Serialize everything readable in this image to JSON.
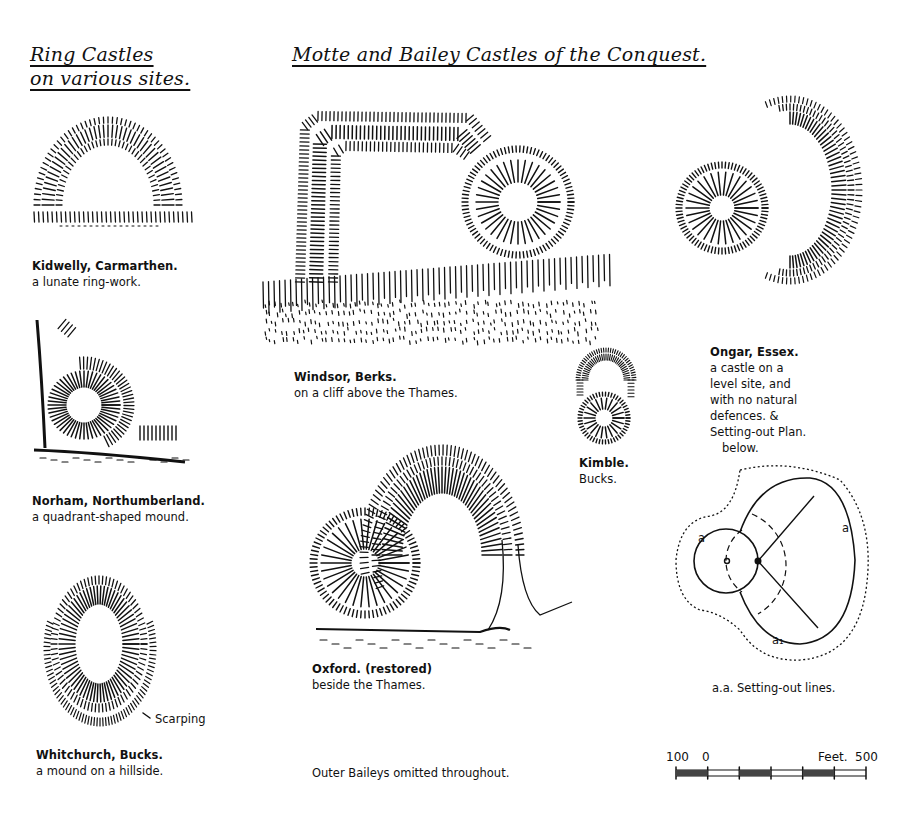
{
  "headings": {
    "ring_castles": [
      "Ring Castles",
      "on various sites."
    ],
    "motte_bailey": "Motte and Bailey Castles of the Conquest."
  },
  "plans": [
    {
      "id": "kidwelly",
      "title": "Kidwelly, Carmarthen.",
      "subtitle": "a lunate ring-work.",
      "category": "Ring Castle"
    },
    {
      "id": "norham",
      "title": "Norham, Northumberland.",
      "subtitle": "a quadrant-shaped mound.",
      "category": "Ring Castle"
    },
    {
      "id": "whitchurch",
      "title": "Whitchurch, Bucks.",
      "subtitle": "a mound on a hillside.",
      "category": "Ring Castle",
      "annotation": "Scarping"
    },
    {
      "id": "windsor",
      "title": "Windsor, Berks.",
      "subtitle": "on a cliff above the Thames.",
      "category": "Motte and Bailey"
    },
    {
      "id": "oxford",
      "title": "Oxford. (restored)",
      "subtitle": "beside the Thames.",
      "category": "Motte and Bailey"
    },
    {
      "id": "kimble",
      "title": "Kimble.",
      "subtitle": "Bucks.",
      "category": "Motte and Bailey"
    },
    {
      "id": "ongar",
      "title": "Ongar, Essex.",
      "subtitle_lines": [
        "a castle on a",
        "level site, and",
        "with no natural",
        "defences. &",
        "Setting-out Plan.",
        "below."
      ],
      "category": "Motte and Bailey"
    }
  ],
  "setting_out_plan": {
    "caption": "a.a. Setting-out lines.",
    "labels": [
      "a",
      "a",
      "a₁"
    ]
  },
  "footer_note": "Outer Baileys omitted throughout.",
  "scale_bar": {
    "unit_label": "Feet.",
    "left_label": "100",
    "zero_label": "0",
    "right_label": "500",
    "ticks": [
      -100,
      0,
      100,
      200,
      300,
      400,
      500
    ]
  },
  "colors": {
    "ink": "#111111",
    "paper": "#ffffff"
  }
}
